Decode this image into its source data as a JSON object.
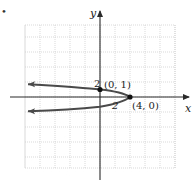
{
  "marker": "•",
  "chart_data": {
    "type": "line",
    "title": "",
    "xlabel": "x",
    "ylabel": "y",
    "equation": "x = 4 - 4y^2",
    "grid": true,
    "grid_spacing": 2,
    "xlim": [
      -12,
      10
    ],
    "ylim": [
      -10,
      10
    ],
    "tick_labels": {
      "x": [
        "2"
      ],
      "y": [
        "2"
      ]
    },
    "series": [
      {
        "name": "parabola",
        "points": [
          {
            "x": -9.6,
            "y": 1.7
          },
          {
            "x": 0,
            "y": 1
          },
          {
            "x": 4,
            "y": 0
          },
          {
            "x": -9.6,
            "y": -1.9
          }
        ]
      }
    ],
    "annotations": [
      {
        "label": "(0, 1)",
        "x": 0,
        "y": 1
      },
      {
        "label": "(4, 0)",
        "x": 4,
        "y": 0
      }
    ]
  },
  "colors": {
    "curve": "#4a4a4a",
    "axis": "#2a2a2a",
    "grid": "#cfcfcf"
  }
}
